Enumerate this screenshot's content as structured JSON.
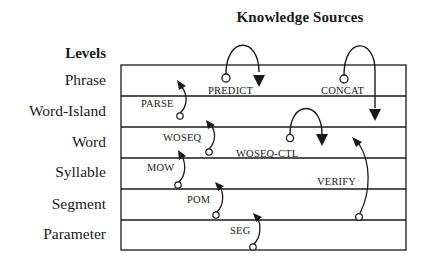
{
  "title": "Knowledge Sources",
  "levels": {
    "header": "Levels",
    "items": [
      {
        "label": "Phrase"
      },
      {
        "label": "Word-Island"
      },
      {
        "label": "Word"
      },
      {
        "label": "Syllable"
      },
      {
        "label": "Segment"
      },
      {
        "label": "Parameter"
      }
    ]
  },
  "knowledge_sources": [
    {
      "name": "PREDICT",
      "from_level": "Phrase",
      "to_level": "Phrase"
    },
    {
      "name": "CONCAT",
      "from_level": "Phrase",
      "to_level": "Word-Island"
    },
    {
      "name": "PARSE",
      "from_level": "Word-Island",
      "to_level": "Phrase"
    },
    {
      "name": "WOSEQ",
      "from_level": "Word",
      "to_level": "Word-Island"
    },
    {
      "name": "WOSEQ-CTL",
      "from_level": "Word",
      "to_level": "Word"
    },
    {
      "name": "MOW",
      "from_level": "Syllable",
      "to_level": "Word"
    },
    {
      "name": "POM",
      "from_level": "Segment",
      "to_level": "Syllable"
    },
    {
      "name": "SEG",
      "from_level": "Parameter",
      "to_level": "Segment"
    },
    {
      "name": "VERIFY",
      "from_level": "Segment",
      "to_level": "Word"
    }
  ],
  "colors": {
    "line": "#1a1a1a",
    "background": "#ffffff"
  }
}
